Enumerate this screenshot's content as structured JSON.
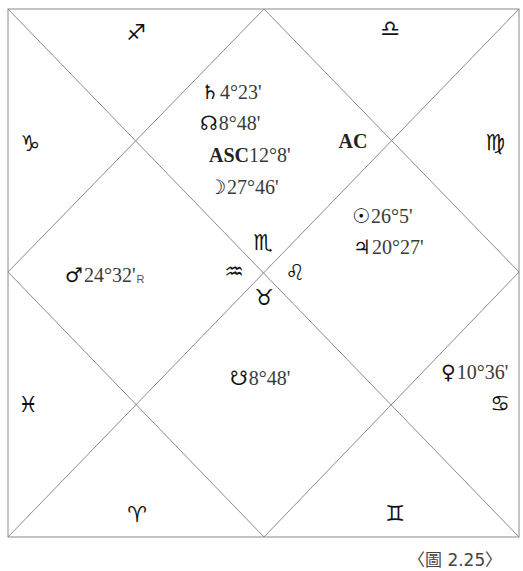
{
  "figure": {
    "caption": "〈圖 2.25〉",
    "line_color": "#8a8a8a",
    "frame": {
      "left": 8,
      "top": 9,
      "right": 519,
      "bottom": 537
    }
  },
  "houses": {
    "signs": [
      {
        "name": "sagittarius",
        "glyph": "♐",
        "x": 136,
        "y": 33
      },
      {
        "name": "libra",
        "glyph": "♎",
        "x": 390,
        "y": 29
      },
      {
        "name": "capricorn",
        "glyph": "♑",
        "x": 30,
        "y": 144
      },
      {
        "name": "virgo",
        "glyph": "♍",
        "x": 495,
        "y": 143
      },
      {
        "name": "scorpio",
        "glyph": "♏",
        "x": 263,
        "y": 243
      },
      {
        "name": "aquarius",
        "glyph": "♒",
        "x": 234,
        "y": 272
      },
      {
        "name": "leo",
        "glyph": "♌",
        "x": 295,
        "y": 273
      },
      {
        "name": "taurus",
        "glyph": "♉",
        "x": 264,
        "y": 298
      },
      {
        "name": "pisces",
        "glyph": "♓",
        "x": 28,
        "y": 405
      },
      {
        "name": "cancer",
        "glyph": "♋",
        "x": 500,
        "y": 404
      },
      {
        "name": "aries",
        "glyph": "♈",
        "x": 137,
        "y": 515
      },
      {
        "name": "gemini",
        "glyph": "♊",
        "x": 395,
        "y": 514
      }
    ]
  },
  "ascendant_marker": {
    "label": "AC"
  },
  "planets": {
    "saturn": {
      "glyph": "♄",
      "position": "4°23'"
    },
    "rahu": {
      "glyph": "☊",
      "position": "8°48'"
    },
    "ascendant": {
      "label": "ASC",
      "position": "12°8'"
    },
    "moon": {
      "glyph": "☽",
      "position": "27°46'"
    },
    "sun": {
      "glyph": "☉",
      "position": "26°5'"
    },
    "jupiter": {
      "glyph": "♃",
      "position": "20°27'"
    },
    "mars": {
      "glyph": "♂",
      "position": "24°32'",
      "retrograde": "R"
    },
    "ketu": {
      "glyph": "☋",
      "position": "8°48'"
    },
    "venus": {
      "glyph": "♀",
      "position": "10°36'"
    }
  }
}
